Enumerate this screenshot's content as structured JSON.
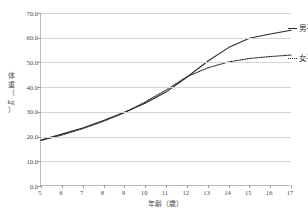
{
  "chart_data": {
    "type": "line",
    "title": "",
    "xlabel": "年齢（歳）",
    "ylabel": "体重（kg）",
    "x": [
      5,
      6,
      7,
      8,
      9,
      10,
      11,
      12,
      13,
      14,
      15,
      16,
      17
    ],
    "xlim": [
      5,
      17
    ],
    "ylim": [
      0.0,
      70.0
    ],
    "yticks": [
      "0.0",
      "10.0",
      "20.0",
      "30.0",
      "40.0",
      "50.0",
      "60.0",
      "70.0"
    ],
    "ytick_values": [
      0,
      10,
      20,
      30,
      40,
      50,
      60,
      70
    ],
    "xticks": [
      "5",
      "6",
      "7",
      "8",
      "9",
      "10",
      "11",
      "12",
      "13",
      "14",
      "15",
      "16",
      "17"
    ],
    "grid": true,
    "legend_position": "right",
    "series": [
      {
        "name": "男子",
        "style": "solid",
        "color": "#2a2a2a",
        "values": [
          18.6,
          21.0,
          23.5,
          26.5,
          29.8,
          33.5,
          38.0,
          44.0,
          50.5,
          56.0,
          59.8,
          61.5,
          63.0
        ]
      },
      {
        "name": "女子",
        "style": "dotted",
        "color": "#2a2a2a",
        "values": [
          18.4,
          20.6,
          23.2,
          26.2,
          29.6,
          34.0,
          38.8,
          44.2,
          47.8,
          50.2,
          51.6,
          52.4,
          53.0
        ]
      }
    ]
  },
  "axes": {
    "y_title_chars": [
      "体",
      "重",
      "（",
      "kg",
      "）"
    ],
    "y_title": "体重（kg）",
    "x_title": "年齢（歳）"
  },
  "legend": {
    "boys_label": "男子",
    "girls_label": "女子"
  }
}
